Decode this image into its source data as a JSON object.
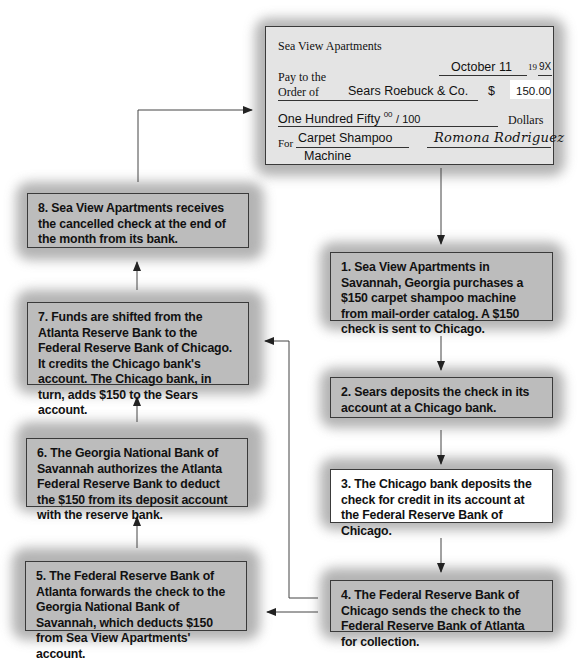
{
  "check": {
    "payer": "Sea View Apartments",
    "date": "October 11",
    "year_prefix": "19",
    "year_suffix": "9X",
    "pay_to_label_1": "Pay to the",
    "pay_to_label_2": "Order of",
    "payee": "Sears Roebuck & Co.",
    "currency_symbol": "$",
    "amount": "150.00",
    "amount_words": "One Hundred Fifty",
    "cents_num": "00",
    "cents_den": "/ 100",
    "dollars_label": "Dollars",
    "for_label": "For",
    "memo_line1": "Carpet Shampoo",
    "memo_line2": "Machine",
    "signature": "Romona Rodriguez"
  },
  "steps": [
    {
      "number": "1.",
      "text": "1.  Sea View Apartments in Savannah, Georgia purchases a $150 carpet shampoo machine from mail-order catalog.  A $150 check is sent to Chicago."
    },
    {
      "number": "2.",
      "text": "2.  Sears deposits the check in its account at a Chicago bank."
    },
    {
      "number": "3.",
      "text": "3.  The Chicago bank deposits the check for credit in its account at the Federal Reserve Bank of Chicago."
    },
    {
      "number": "4.",
      "text": "4.  The Federal Reserve Bank of Chicago sends the check to the Federal Reserve Bank of Atlanta for collection."
    },
    {
      "number": "5.",
      "text": "5.  The Federal Reserve Bank of Atlanta forwards the check to the Georgia National Bank of Savannah, which deducts $150 from Sea View Apartments' account."
    },
    {
      "number": "6.",
      "text": "6.  The Georgia National Bank of Savannah authorizes the Atlanta Federal Reserve Bank to deduct the $150 from its deposit account with the reserve bank."
    },
    {
      "number": "7.",
      "text": "7.  Funds are shifted from the Atlanta Reserve Bank to the Federal Reserve Bank of Chicago. It credits the Chicago bank's account.  The Chicago bank, in turn, adds $150 to the Sears account."
    },
    {
      "number": "8.",
      "text": "8.  Sea View Apartments receives the cancelled check at the end of the month from its bank."
    }
  ],
  "colors": {
    "box_fill": "#bcbcbc",
    "box_fill_highlight": "#ffffff",
    "check_fill": "#e4e4e4",
    "border": "#3a3a3a",
    "arrow": "#333333"
  }
}
